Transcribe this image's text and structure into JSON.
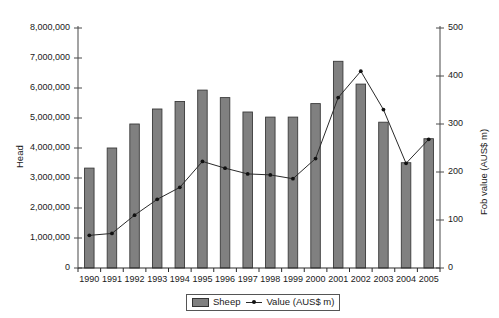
{
  "chart_data": {
    "type": "bar",
    "title": "",
    "xlabel": "",
    "ylabel": "Head",
    "y2label": "Fob value (AUS$ m)",
    "categories": [
      "1990",
      "1991",
      "1992",
      "1993",
      "1994",
      "1995",
      "1996",
      "1997",
      "1998",
      "1999",
      "2000",
      "2001",
      "2002",
      "2003",
      "2004",
      "2005"
    ],
    "ylim": [
      0,
      8000000
    ],
    "y2lim": [
      0,
      500
    ],
    "yticks": [
      "0",
      "1,000,000",
      "2,000,000",
      "3,000,000",
      "4,000,000",
      "5,000,000",
      "6,000,000",
      "7,000,000",
      "8,000,000"
    ],
    "ytick_values": [
      0,
      1000000,
      2000000,
      3000000,
      4000000,
      5000000,
      6000000,
      7000000,
      8000000
    ],
    "y2ticks": [
      "0",
      "100",
      "200",
      "300",
      "400",
      "500"
    ],
    "y2tick_values": [
      0,
      100,
      200,
      300,
      400,
      500
    ],
    "grid": false,
    "legend_position": "bottom",
    "series": [
      {
        "name": "Sheep",
        "kind": "bar",
        "axis": "left",
        "color": "#808080",
        "values": [
          3330000,
          4000000,
          4800000,
          5300000,
          5550000,
          5930000,
          5680000,
          5200000,
          5030000,
          5030000,
          5480000,
          6890000,
          6130000,
          4860000,
          3510000,
          4310000
        ]
      },
      {
        "name": "Value (AUS$ m)",
        "kind": "line",
        "axis": "right",
        "color": "#2a2a2a",
        "values": [
          68,
          72,
          110,
          143,
          168,
          222,
          208,
          196,
          194,
          186,
          228,
          355,
          410,
          330,
          218,
          268
        ]
      }
    ]
  },
  "legend": {
    "bar_label": "Sheep",
    "line_label": "Value (AUS$ m)"
  }
}
